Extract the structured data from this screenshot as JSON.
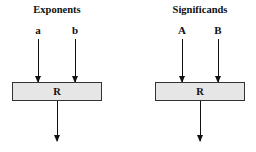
{
  "panels": [
    {
      "title": "Exponents",
      "inputs": [
        "a",
        "b"
      ],
      "box_label": "R"
    },
    {
      "title": "Significands",
      "inputs": [
        "A",
        "B"
      ],
      "box_label": "R"
    }
  ],
  "colors": {
    "box_fill": "#e6e6e6",
    "stroke": "#111111",
    "background": "#ffffff"
  }
}
